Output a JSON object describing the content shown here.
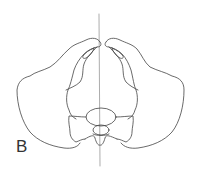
{
  "figure": {
    "label": "B",
    "stroke_color": "#444444",
    "midline_color": "#888888"
  }
}
